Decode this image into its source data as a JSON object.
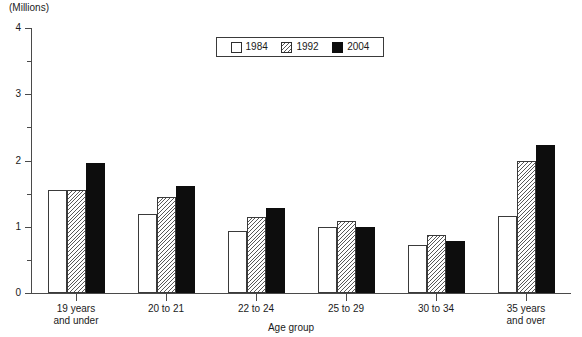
{
  "units_caption": "(Millions)",
  "axis_title_x": "Age group",
  "legend": {
    "entries": [
      {
        "label": "1984",
        "pattern": "empty-white",
        "swatch": "legend-swatch-1984"
      },
      {
        "label": "1992",
        "pattern": "diagonal-hatch",
        "swatch": "legend-swatch-1992"
      },
      {
        "label": "2004",
        "pattern": "solid-black",
        "swatch": "legend-swatch-2004"
      }
    ]
  },
  "y_axis": {
    "ticks": [
      "0",
      "1",
      "2",
      "3",
      "4"
    ],
    "minor_tick_step": 0.5,
    "min": 0,
    "max": 4
  },
  "chart_data": {
    "type": "bar",
    "title": "(Millions)",
    "xlabel": "Age group",
    "ylabel": "(Millions)",
    "ylim": [
      0,
      4
    ],
    "grid": false,
    "legend_position": "top-center",
    "categories": [
      "19 years\nand under",
      "20 to 21",
      "22 to 24",
      "25 to 29",
      "30 to 34",
      "35 years\nand over"
    ],
    "series": [
      {
        "name": "1984",
        "values": [
          1.55,
          1.2,
          0.94,
          1.0,
          0.73,
          1.16
        ]
      },
      {
        "name": "1992",
        "values": [
          1.56,
          1.45,
          1.14,
          1.08,
          0.88,
          1.99
        ]
      },
      {
        "name": "2004",
        "values": [
          1.97,
          1.62,
          1.29,
          1.0,
          0.79,
          2.23
        ]
      }
    ]
  }
}
